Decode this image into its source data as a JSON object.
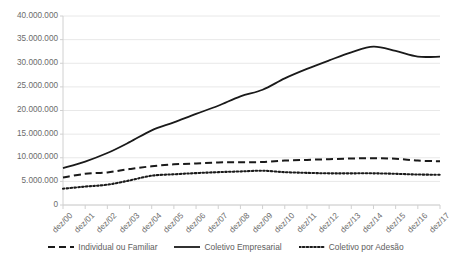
{
  "chart_data": {
    "type": "line",
    "title": "",
    "subtitle": "",
    "xlabel": "",
    "ylabel": "",
    "grid": true,
    "legend_position": "bottom",
    "ylim": [
      0,
      40000000
    ],
    "ytick_labels": [
      "40.000.000",
      "35.000.000",
      "30.000.000",
      "25.000.000",
      "20.000.000",
      "15.000.000",
      "10.000.000",
      "5.000.000",
      "0"
    ],
    "ytick_values": [
      40000000,
      35000000,
      30000000,
      25000000,
      20000000,
      15000000,
      10000000,
      5000000,
      0
    ],
    "categories": [
      "dez/00",
      "dez/01",
      "dez/02",
      "dez/03",
      "dez/04",
      "dez/05",
      "dez/06",
      "dez/07",
      "dez/08",
      "dez/09",
      "dez/10",
      "dez/11",
      "dez/12",
      "dez/13",
      "dez/14",
      "dez/15",
      "dez/16",
      "dez/17"
    ],
    "series": [
      {
        "name": "Individual ou Familiar",
        "style": "dashed",
        "color": "#1a1a1a",
        "values": [
          5800000,
          6600000,
          6900000,
          7600000,
          8200000,
          8600000,
          8800000,
          9000000,
          9050000,
          9100000,
          9400000,
          9550000,
          9700000,
          9850000,
          9900000,
          9800000,
          9400000,
          9250000
        ]
      },
      {
        "name": "Coletivo Empresarial",
        "style": "solid",
        "color": "#1a1a1a",
        "values": [
          7800000,
          9200000,
          11000000,
          13300000,
          15800000,
          17500000,
          19300000,
          21000000,
          23000000,
          24400000,
          26800000,
          28800000,
          30600000,
          32300000,
          33500000,
          32600000,
          31400000,
          31400000
        ]
      },
      {
        "name": "Coletivo por Adesão",
        "style": "dotted",
        "color": "#1a1a1a",
        "values": [
          3450000,
          3900000,
          4300000,
          5200000,
          6200000,
          6500000,
          6750000,
          6950000,
          7100000,
          7250000,
          6950000,
          6800000,
          6700000,
          6700000,
          6700000,
          6600000,
          6450000,
          6400000
        ]
      }
    ]
  },
  "legend": {
    "items": [
      {
        "label": "Individual ou Familiar",
        "style": "dashed"
      },
      {
        "label": "Coletivo Empresarial",
        "style": "solid"
      },
      {
        "label": "Coletivo por Adesão",
        "style": "dotted"
      }
    ]
  },
  "colors": {
    "line": "#1a1a1a",
    "grid": "#e8e8e8",
    "axis": "#d0d0d0",
    "tick_text": "#6b6b6b"
  }
}
